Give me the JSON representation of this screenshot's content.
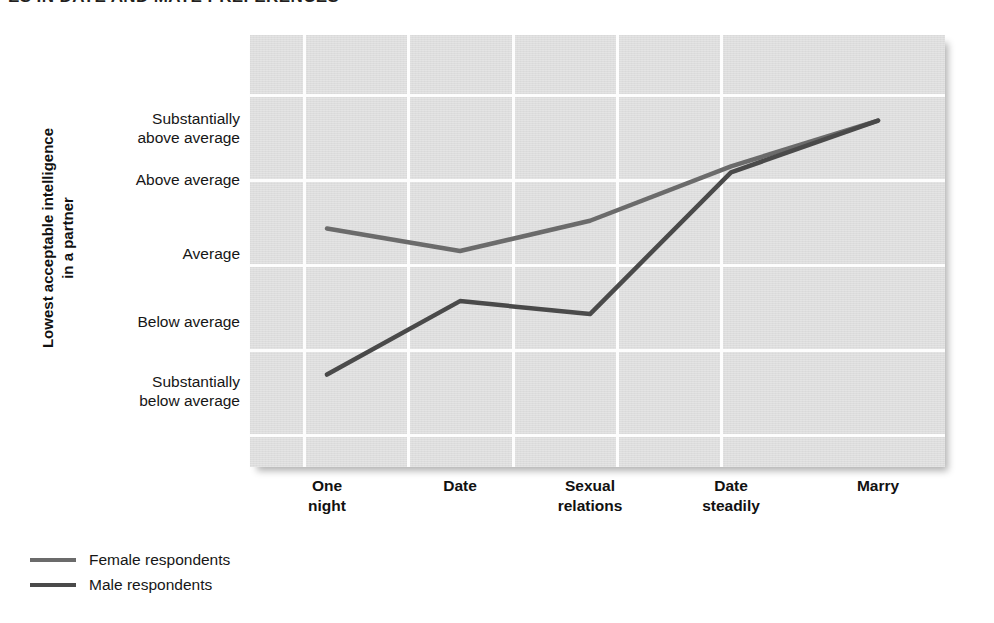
{
  "title": "ES IN DATE AND MATE PREFERENCES",
  "chart_data": {
    "type": "line",
    "title": "ES IN DATE AND MATE PREFERENCES",
    "xlabel": "",
    "ylabel": "Lowest acceptable intelligence in a partner",
    "ylabel_lines": [
      "Lowest acceptable intelligence",
      "in a partner"
    ],
    "categories": [
      "One night",
      "Date",
      "Sexual relations",
      "Date steadily",
      "Marry"
    ],
    "category_lines": [
      [
        "One",
        "night"
      ],
      [
        "Date"
      ],
      [
        "Sexual",
        "relations"
      ],
      [
        "Date",
        "steadily"
      ],
      [
        "Marry"
      ]
    ],
    "ytick_labels": [
      "Substantially above average",
      "Above average",
      "Average",
      "Below average",
      "Substantially below average"
    ],
    "ytick_label_lines": [
      [
        "Substantially",
        "above average"
      ],
      [
        "Above average"
      ],
      [
        "Average"
      ],
      [
        "Below average"
      ],
      [
        "Substantially",
        "below average"
      ]
    ],
    "ytick_values": [
      5,
      4,
      3,
      2,
      1
    ],
    "ylim": [
      0.5,
      5.5
    ],
    "grid": true,
    "gridlines_horizontal": 5,
    "gridlines_vertical": 5,
    "legend_position": "below-left",
    "series": [
      {
        "name": "Female respondents",
        "color": "#6b6b6b",
        "values": [
          3.26,
          3.0,
          3.35,
          3.98,
          4.51
        ],
        "value_labels": [
          "slightly above average",
          "average",
          "slightly above average",
          "near above average",
          "between above and substantially above average"
        ]
      },
      {
        "name": "Male respondents",
        "color": "#4a4a4a",
        "values": [
          1.57,
          2.42,
          2.27,
          3.91,
          4.51
        ],
        "value_labels": [
          "between substantially below and below average",
          "slightly above below average",
          "slightly above below average",
          "near above average",
          "between above and substantially above average"
        ]
      }
    ]
  },
  "legend": {
    "items": [
      {
        "label": "Female respondents",
        "color": "#6b6b6b"
      },
      {
        "label": "Male respondents",
        "color": "#4a4a4a"
      }
    ]
  },
  "colors": {
    "plot_background": "#dddddd",
    "gridline": "#fdfdfd",
    "page_background": "#ffffff",
    "text": "#111111",
    "female_line": "#6b6b6b",
    "male_line": "#4a4a4a"
  }
}
